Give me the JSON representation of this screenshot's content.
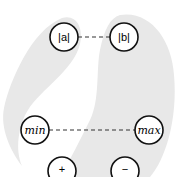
{
  "diagram": {
    "background": "#ffffff",
    "region_color": "#e8e8e8",
    "nodes": [
      {
        "id": "abs_a",
        "label": "|a|",
        "cx": 64,
        "cy": 37
      },
      {
        "id": "abs_b",
        "label": "|b|",
        "cx": 124,
        "cy": 37
      },
      {
        "id": "min",
        "label": "min",
        "cx": 35,
        "cy": 130
      },
      {
        "id": "max",
        "label": "max",
        "cx": 149,
        "cy": 130
      },
      {
        "id": "plus",
        "label": "+",
        "cx": 62,
        "cy": 171
      },
      {
        "id": "minus",
        "label": "−",
        "cx": 125,
        "cy": 171
      }
    ],
    "edges": [
      {
        "from": "abs_a",
        "to": "abs_b",
        "style": "dashed"
      },
      {
        "from": "min",
        "to": "max",
        "style": "dashed"
      }
    ]
  }
}
